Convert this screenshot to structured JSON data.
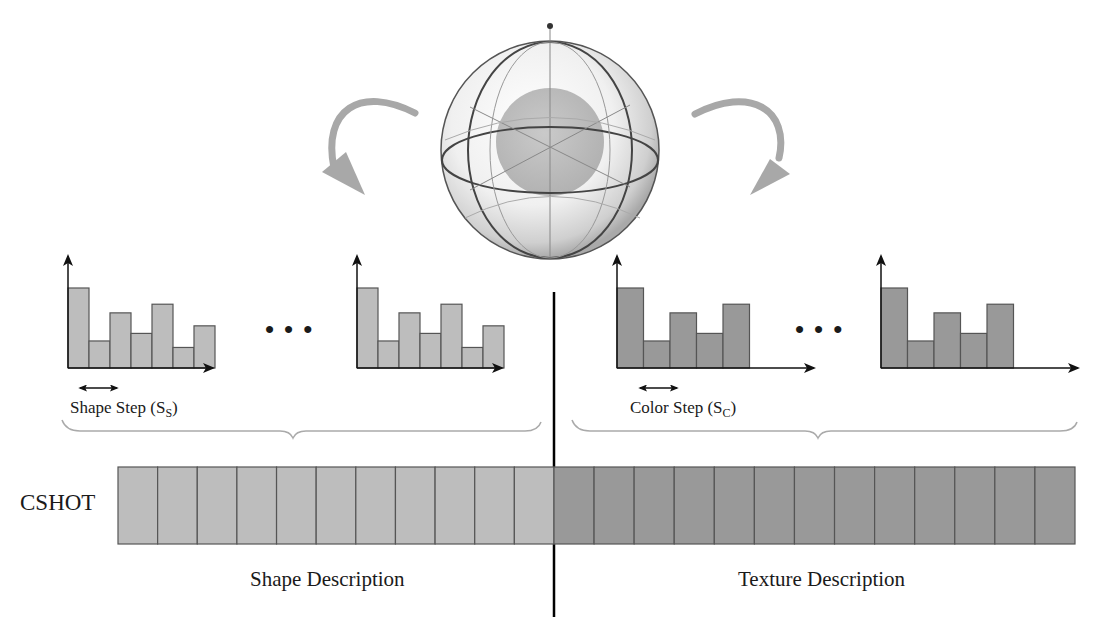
{
  "colors": {
    "shape_fill": "#bdbdbd",
    "texture_fill": "#999999",
    "outline": "#555555",
    "axis": "#111111",
    "arrow_gray": "#a8a8a8",
    "divider": "#000000"
  },
  "labels": {
    "cshot": "CSHOT",
    "shape_step": "Shape Step (S",
    "shape_step_sub": "S",
    "color_step": "Color Step (S",
    "color_step_sub": "C",
    "close_paren": ")",
    "shape_description": "Shape Description",
    "texture_description": "Texture Description",
    "ellipsis": "•••"
  },
  "chart_data": [
    {
      "type": "bar",
      "title": "Shape histogram (first)",
      "categories": [
        "1",
        "2",
        "3",
        "4",
        "5",
        "6",
        "7"
      ],
      "values": [
        0.74,
        0.25,
        0.51,
        0.32,
        0.59,
        0.19,
        0.39
      ],
      "xlabel": "",
      "ylabel": ""
    },
    {
      "type": "bar",
      "title": "Shape histogram (last)",
      "categories": [
        "1",
        "2",
        "3",
        "4",
        "5",
        "6",
        "7"
      ],
      "values": [
        0.74,
        0.25,
        0.51,
        0.32,
        0.59,
        0.19,
        0.39
      ],
      "xlabel": "",
      "ylabel": ""
    },
    {
      "type": "bar",
      "title": "Color histogram (first)",
      "categories": [
        "1",
        "2",
        "3",
        "4",
        "5"
      ],
      "values": [
        0.74,
        0.25,
        0.51,
        0.32,
        0.59
      ],
      "xlabel": "",
      "ylabel": ""
    },
    {
      "type": "bar",
      "title": "Color histogram (last)",
      "categories": [
        "1",
        "2",
        "3",
        "4",
        "5"
      ],
      "values": [
        0.74,
        0.25,
        0.51,
        0.32,
        0.59
      ],
      "xlabel": "",
      "ylabel": ""
    },
    {
      "type": "table",
      "title": "CSHOT descriptor vector",
      "segments": [
        {
          "name": "Shape Description",
          "cells": 11
        },
        {
          "name": "Texture Description",
          "cells": 13
        }
      ]
    }
  ]
}
